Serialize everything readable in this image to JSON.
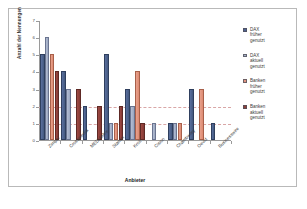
{
  "chart_data": {
    "type": "bar",
    "title": "",
    "xlabel": "Anbieter",
    "ylabel": "Anzahl der Nennungen",
    "ylim": [
      0,
      7
    ],
    "yticks": [
      "0",
      "1",
      "2",
      "3",
      "4",
      "5",
      "6",
      "7"
    ],
    "grid": "horizontal-dashed",
    "legend_position": "right",
    "categories": [
      "Zimpel",
      "Crossmedia",
      "MEDIAMee",
      "Stamm",
      "Kroll",
      "Cision",
      "Chambwrey",
      "Oevid",
      "Businesswire"
    ],
    "series": [
      {
        "name": "DAX früher genutzt",
        "color": "#4d6291",
        "values": [
          5,
          4,
          2,
          5,
          3,
          0,
          1,
          3,
          1
        ]
      },
      {
        "name": "DAX aktuell genutzt",
        "color": "#a7b2c9",
        "values": [
          6,
          3,
          0,
          1,
          2,
          1,
          1,
          0,
          0
        ]
      },
      {
        "name": "Banken früher genutzt",
        "color": "#e19480",
        "values": [
          5,
          0,
          0,
          1,
          4,
          0,
          1,
          3,
          0
        ]
      },
      {
        "name": "Banken aktuell genutzt",
        "color": "#8f4139",
        "values": [
          4,
          3,
          2,
          2,
          1,
          0,
          0,
          0,
          0
        ]
      }
    ],
    "legend_entries": [
      {
        "label_lines": [
          "DAX",
          "früher",
          "genutzt"
        ],
        "color": "#4d6291"
      },
      {
        "label_lines": [
          "DAX",
          "aktuell",
          "genutzt"
        ],
        "color": "#a7b2c9"
      },
      {
        "label_lines": [
          "Banken",
          "früher",
          "genutzt"
        ],
        "color": "#e19480"
      },
      {
        "label_lines": [
          "Banken",
          "aktuell",
          "genutzt"
        ],
        "color": "#8f4139"
      }
    ]
  }
}
